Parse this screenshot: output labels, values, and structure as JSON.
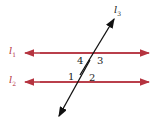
{
  "diagram": {
    "lines": [
      {
        "id": "l1",
        "label": "l",
        "sub": "1",
        "color": "#b5333f"
      },
      {
        "id": "l2",
        "label": "l",
        "sub": "2",
        "color": "#b5333f"
      },
      {
        "id": "l3",
        "label": "l",
        "sub": "3",
        "color": "#111111"
      }
    ],
    "angles": [
      "1",
      "2",
      "3",
      "4"
    ]
  }
}
